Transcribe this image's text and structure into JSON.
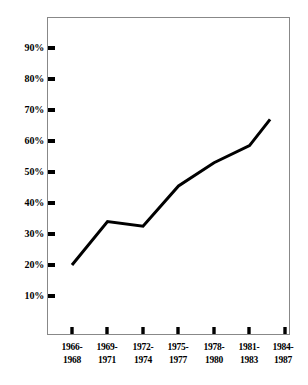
{
  "chart_data": {
    "type": "line",
    "title": "",
    "subtitle": "",
    "xlabel": "",
    "ylabel": "",
    "categories": [
      "1966-1968",
      "1969-1971",
      "1972-1974",
      "1975-1977",
      "1978-1980",
      "1981-1983",
      "1984-1987"
    ],
    "category_lines": [
      [
        "1966-",
        "1968"
      ],
      [
        "1969-",
        "1971"
      ],
      [
        "1972-",
        "1974"
      ],
      [
        "1975-",
        "1977"
      ],
      [
        "1978-",
        "1980"
      ],
      [
        "1981-",
        "1983"
      ],
      [
        "1984-",
        "1987"
      ]
    ],
    "values": [
      20,
      34,
      32.5,
      45.5,
      53,
      58.5,
      67
    ],
    "value_labels": [
      "20%",
      "34%",
      "32.5%",
      "45.5%",
      "53%",
      "58.5%",
      "67%"
    ],
    "ylim": [
      0,
      95
    ],
    "y_ticks": [
      10,
      20,
      30,
      40,
      50,
      60,
      70,
      80,
      90
    ],
    "y_tick_labels": [
      "10%",
      "20%",
      "30%",
      "40%",
      "50%",
      "60%",
      "70%",
      "80%",
      "90%"
    ],
    "grid": false,
    "legend": false,
    "legend_position": "none",
    "series": [
      {
        "name": "percentage",
        "values": [
          20,
          34,
          32.5,
          45.5,
          53,
          58.5,
          67
        ]
      }
    ],
    "colors": {
      "line": "#000000",
      "frame": "#888888",
      "tick": "#000000",
      "background": "#ffffff",
      "text": "#000000"
    },
    "line_width": 3
  },
  "caption": {
    "partial_text": ""
  }
}
